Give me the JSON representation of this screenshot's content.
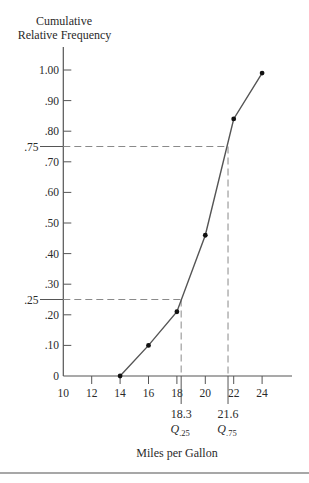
{
  "labels": {
    "ylabel_line1": "Cumulative",
    "ylabel_line2": "Relative Frequency",
    "xlabel": "Miles per Gallon"
  },
  "colors": {
    "line": "#555555",
    "axis": "#555555",
    "dashed": "#8a8a8a",
    "marker": "#111111",
    "rule": "#8a8a8a",
    "text": "#2a2a2a"
  },
  "chart_data": {
    "type": "line",
    "title": "",
    "xlabel": "Miles per Gallon",
    "ylabel": "Cumulative Relative Frequency",
    "x": [
      14,
      16,
      18,
      20,
      22,
      24
    ],
    "series": [
      {
        "name": "Cumulative Relative Frequency",
        "values": [
          0.0,
          0.1,
          0.21,
          0.46,
          0.84,
          0.99
        ]
      }
    ],
    "xlim": [
      10,
      25.5
    ],
    "ylim": [
      0,
      1.07
    ],
    "grid": false,
    "legend": null,
    "markers": true,
    "xticks": [
      {
        "value": 10,
        "label": "10"
      },
      {
        "value": 12,
        "label": "12"
      },
      {
        "value": 14,
        "label": "14"
      },
      {
        "value": 16,
        "label": "16"
      },
      {
        "value": 18,
        "label": "18"
      },
      {
        "value": 20,
        "label": "20"
      },
      {
        "value": 22,
        "label": "22"
      },
      {
        "value": 24,
        "label": "24"
      }
    ],
    "yticks": [
      {
        "value": 0.0,
        "label": "0"
      },
      {
        "value": 0.1,
        "label": ".10"
      },
      {
        "value": 0.2,
        "label": ".20"
      },
      {
        "value": 0.3,
        "label": ".30"
      },
      {
        "value": 0.4,
        "label": ".40"
      },
      {
        "value": 0.5,
        "label": ".50"
      },
      {
        "value": 0.6,
        "label": ".60"
      },
      {
        "value": 0.7,
        "label": ".70"
      },
      {
        "value": 0.8,
        "label": ".80"
      },
      {
        "value": 0.9,
        "label": ".90"
      },
      {
        "value": 1.0,
        "label": "1.00"
      }
    ],
    "annotations": [
      {
        "type": "quartile",
        "y": 0.25,
        "y_label": ".25",
        "x": 18.3,
        "x_label": "18.3",
        "symbol": "Q",
        "subscript": ".25"
      },
      {
        "type": "quartile",
        "y": 0.75,
        "y_label": ".75",
        "x": 21.6,
        "x_label": "21.6",
        "symbol": "Q",
        "subscript": ".75"
      }
    ]
  }
}
